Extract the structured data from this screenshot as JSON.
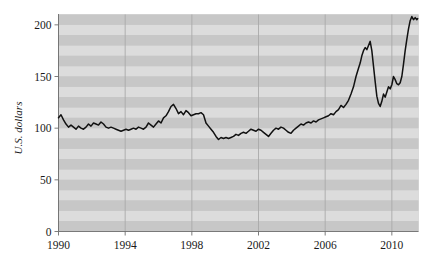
{
  "chart_data": {
    "type": "line",
    "title": "",
    "subtitle": "",
    "xlabel": "",
    "ylabel": "U.S. dollars",
    "xlim": [
      1990,
      2011.6
    ],
    "ylim": [
      0,
      210
    ],
    "grid": "vertical gridlines at x ticks; horizontal alternating shaded bands every 10 units",
    "legend": "none",
    "xticks": [
      "1990",
      "1994",
      "1998",
      "2002",
      "2006",
      "2010"
    ],
    "xtick_values": [
      1990,
      1994,
      1998,
      2002,
      2006,
      2010
    ],
    "yticks": [
      "0",
      "50",
      "100",
      "150",
      "200"
    ],
    "ytick_values": [
      0,
      50,
      100,
      150,
      200
    ],
    "series": [
      {
        "name": "U.S. dollars",
        "color": "#111111",
        "x": [
          1990.0,
          1990.15,
          1990.3,
          1990.45,
          1990.6,
          1990.75,
          1990.9,
          1991.05,
          1991.2,
          1991.35,
          1991.5,
          1991.65,
          1991.8,
          1991.95,
          1992.1,
          1992.25,
          1992.4,
          1992.55,
          1992.7,
          1992.85,
          1993.0,
          1993.15,
          1993.3,
          1993.45,
          1993.6,
          1993.75,
          1993.9,
          1994.05,
          1994.2,
          1994.35,
          1994.5,
          1994.65,
          1994.8,
          1994.95,
          1995.1,
          1995.25,
          1995.4,
          1995.55,
          1995.7,
          1995.85,
          1996.0,
          1996.15,
          1996.3,
          1996.45,
          1996.6,
          1996.75,
          1996.9,
          1997.05,
          1997.2,
          1997.35,
          1997.5,
          1997.65,
          1997.8,
          1997.95,
          1998.1,
          1998.25,
          1998.4,
          1998.55,
          1998.7,
          1998.85,
          1999.0,
          1999.15,
          1999.3,
          1999.45,
          1999.6,
          1999.75,
          1999.9,
          2000.05,
          2000.2,
          2000.35,
          2000.5,
          2000.65,
          2000.8,
          2000.95,
          2001.1,
          2001.25,
          2001.4,
          2001.55,
          2001.7,
          2001.85,
          2002.0,
          2002.15,
          2002.3,
          2002.45,
          2002.6,
          2002.75,
          2002.9,
          2003.05,
          2003.2,
          2003.35,
          2003.5,
          2003.65,
          2003.8,
          2003.95,
          2004.1,
          2004.25,
          2004.4,
          2004.55,
          2004.7,
          2004.85,
          2005.0,
          2005.15,
          2005.3,
          2005.45,
          2005.6,
          2005.75,
          2005.9,
          2006.05,
          2006.2,
          2006.35,
          2006.5,
          2006.65,
          2006.8,
          2006.95,
          2007.1,
          2007.25,
          2007.4,
          2007.55,
          2007.7,
          2007.85,
          2008.0,
          2008.1,
          2008.2,
          2008.3,
          2008.4,
          2008.5,
          2008.6,
          2008.7,
          2008.8,
          2008.9,
          2009.0,
          2009.1,
          2009.2,
          2009.3,
          2009.4,
          2009.5,
          2009.6,
          2009.7,
          2009.8,
          2009.9,
          2010.0,
          2010.1,
          2010.2,
          2010.3,
          2010.4,
          2010.5,
          2010.6,
          2010.7,
          2010.8,
          2010.9,
          2011.0,
          2011.1,
          2011.2,
          2011.3,
          2011.4,
          2011.5,
          2011.55
        ],
        "y": [
          110,
          113,
          108,
          104,
          101,
          103,
          101,
          99,
          102,
          100,
          99,
          101,
          104,
          102,
          105,
          104,
          103,
          106,
          104,
          101,
          100,
          101,
          100,
          99,
          98,
          97,
          98,
          99,
          98,
          99,
          100,
          99,
          101,
          100,
          99,
          101,
          105,
          103,
          101,
          104,
          107,
          105,
          110,
          112,
          116,
          121,
          123,
          119,
          114,
          116,
          113,
          117,
          115,
          112,
          113,
          114,
          114,
          115,
          113,
          105,
          102,
          99,
          96,
          92,
          89,
          91,
          90,
          91,
          90,
          91,
          92,
          94,
          93,
          95,
          96,
          95,
          97,
          99,
          98,
          97,
          99,
          98,
          96,
          94,
          92,
          95,
          98,
          100,
          99,
          101,
          100,
          98,
          96,
          95,
          98,
          100,
          102,
          104,
          103,
          105,
          106,
          105,
          107,
          106,
          108,
          109,
          110,
          111,
          112,
          114,
          113,
          116,
          118,
          122,
          120,
          123,
          127,
          133,
          140,
          150,
          158,
          163,
          170,
          175,
          178,
          176,
          180,
          184,
          175,
          160,
          145,
          131,
          124,
          121,
          126,
          133,
          130,
          135,
          140,
          138,
          142,
          150,
          147,
          143,
          142,
          144,
          150,
          162,
          175,
          186,
          196,
          204,
          208,
          205,
          207,
          205,
          206
        ]
      }
    ]
  },
  "axes": {
    "ylabel": "U.S. dollars",
    "ytick_labels": [
      "200",
      "150",
      "100",
      "50",
      "0"
    ],
    "xtick_labels": [
      "1990",
      "1994",
      "1998",
      "2002",
      "2006",
      "2010"
    ]
  },
  "colors": {
    "line": "#111111",
    "band_dark": "#c7c7c7",
    "band_light": "#dcdcdc",
    "gridline": "#a9a9a9",
    "axis": "#6e6e6e",
    "text": "#1a1a1a",
    "background": "#ffffff"
  }
}
